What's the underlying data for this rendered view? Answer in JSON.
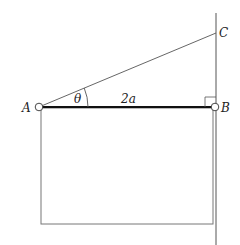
{
  "diagram": {
    "points": {
      "A": {
        "label": "A",
        "x": 39,
        "y": 107
      },
      "B": {
        "label": "B",
        "x": 215,
        "y": 107
      },
      "C": {
        "label": "C",
        "x": 215,
        "y": 33
      }
    },
    "angle_label": "θ",
    "length_label": "2a",
    "right_angle_marker": true,
    "colors": {
      "stroke": "#555555",
      "bar": "#111111",
      "background": "#ffffff"
    }
  }
}
